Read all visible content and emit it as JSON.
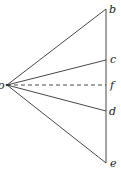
{
  "diagram": {
    "origin": {
      "label": "o",
      "x": 7,
      "y": 85
    },
    "vertical_line": {
      "x": 106,
      "y1": 9,
      "y2": 163
    },
    "points": [
      {
        "label": "b",
        "y": 9,
        "style": "solid"
      },
      {
        "label": "c",
        "y": 60,
        "style": "solid"
      },
      {
        "label": "f",
        "y": 85,
        "style": "dashed"
      },
      {
        "label": "d",
        "y": 111,
        "style": "solid"
      },
      {
        "label": "e",
        "y": 163,
        "style": "solid"
      }
    ],
    "stroke_color": "#333333"
  }
}
